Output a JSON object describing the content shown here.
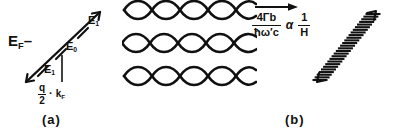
{
  "figure": {
    "type": "physics-schematic",
    "background": "#ffffff",
    "ink": "#111111",
    "panels": [
      {
        "id": "a",
        "caption": "(a)"
      },
      {
        "id": "b",
        "caption": "(b)"
      },
      {
        "id": "c",
        "caption": "(c)"
      }
    ]
  },
  "panel_a": {
    "description": "Diagonal energy line crossing the Fermi level with three tick marks labelled E1, E0, E1 and a vertical segment marking q/2 = kF",
    "fermi_label": {
      "symbol": "E",
      "subscript": "F",
      "dash": "–"
    },
    "levels": [
      {
        "symbol": "E",
        "subscript": "1",
        "position": "top"
      },
      {
        "symbol": "E",
        "subscript": "0",
        "position": "middle"
      },
      {
        "symbol": "E",
        "subscript": "1",
        "position": "bottom"
      }
    ],
    "axis_label": {
      "numerator": "q",
      "denominator": "2",
      "operator": "·",
      "symbol": "k",
      "symbol_subscript": "F"
    },
    "caption": "(a)"
  },
  "panel_b": {
    "description": "Three rows of crossing sinusoidal waves forming lens-shaped envelopes",
    "rows": 3,
    "waves_per_row": 2,
    "cycles": 3,
    "caption": "(b)"
  },
  "panel_mid": {
    "arrow": "→",
    "expression": {
      "numerator_coefficient": "4",
      "numerator_symbol": "Γ",
      "numerator_subscript": "b",
      "denominator_hbar": "ħ",
      "denominator_symbol": "ω",
      "denominator_prime": "′",
      "denominator_subscript": "c",
      "relation": "α",
      "rhs_numerator": "1",
      "rhs_denominator": "H"
    },
    "plain_text": "4Γb / ħω'c α 1/H"
  },
  "panel_c": {
    "description": "Diagonal ladder of closely spaced horizontal line segments with arrowheads at both ends",
    "rungs": 26,
    "caption": "(c)"
  }
}
